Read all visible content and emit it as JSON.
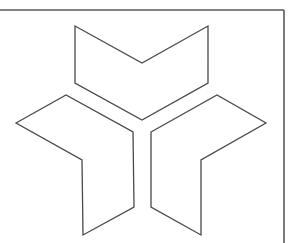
{
  "figure": {
    "line_color": "#4a4a4a",
    "frame_color": "#5a5a5a",
    "background": "#ffffff",
    "frame": {
      "top": {
        "x1": 0,
        "y1": 10,
        "x2": 284,
        "y2": 10
      },
      "right": {
        "x1": 284,
        "y1": 10,
        "x2": 284,
        "y2": 243
      }
    },
    "pieces": [
      {
        "name": "top-chevron",
        "points": "75,26 142,63 208,26 208,83 142,120 75,83"
      },
      {
        "name": "left-chevron",
        "points": "16,123 66,95 133,132 134,207 83,235 82,160"
      },
      {
        "name": "right-chevron",
        "points": "151,132 217,95 266,123 201,160 201,235 151,207"
      }
    ]
  }
}
